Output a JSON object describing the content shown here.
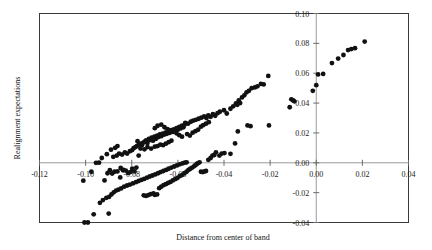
{
  "chart_data": {
    "type": "scatter",
    "title": "",
    "xlabel": "Distance from center  of band",
    "ylabel": "Realignment expectations",
    "xlim": [
      -0.12,
      0.04
    ],
    "ylim": [
      -0.04,
      0.1
    ],
    "grid": false,
    "legend": "none",
    "xticks": [
      "-0.12",
      "-0.10",
      "-0.08",
      "-0.06",
      "-0.04",
      "-0.02",
      "0.00",
      "0.02",
      "0.04"
    ],
    "xtick_values": [
      -0.12,
      -0.1,
      -0.08,
      -0.06,
      -0.04,
      -0.02,
      0.0,
      0.02,
      0.04
    ],
    "yticks": [
      "0.10",
      "0.08",
      "0.06",
      "0.04",
      "0.02",
      "0.00",
      "-0.02",
      "-0.04"
    ],
    "ytick_values": [
      0.1,
      0.08,
      0.06,
      0.04,
      0.02,
      0.0,
      -0.02,
      -0.04
    ],
    "yaxis_position": "at x = 0.00 (interior, right side)",
    "point_color": "#111111",
    "point_radius_px": 2.4,
    "series": [
      {
        "name": "Realignment expectations vs distance from center of band",
        "points": [
          [
            -0.1005,
            -0.04
          ],
          [
            -0.099,
            -0.04
          ],
          [
            -0.0965,
            -0.0345
          ],
          [
            -0.09,
            -0.034
          ],
          [
            -0.0938,
            -0.0268
          ],
          [
            -0.0925,
            -0.025
          ],
          [
            -0.091,
            -0.0235
          ],
          [
            -0.0898,
            -0.0228
          ],
          [
            -0.0888,
            -0.0212
          ],
          [
            -0.0878,
            -0.0198
          ],
          [
            -0.0868,
            -0.0186
          ],
          [
            -0.0858,
            -0.018
          ],
          [
            -0.0846,
            -0.0172
          ],
          [
            -0.0833,
            -0.016
          ],
          [
            -0.082,
            -0.0152
          ],
          [
            -0.0808,
            -0.0146
          ],
          [
            -0.0795,
            -0.0138
          ],
          [
            -0.0782,
            -0.013
          ],
          [
            -0.077,
            -0.0122
          ],
          [
            -0.0758,
            -0.0115
          ],
          [
            -0.0746,
            -0.0108
          ],
          [
            -0.0734,
            -0.01
          ],
          [
            -0.0722,
            -0.0092
          ],
          [
            -0.071,
            -0.0085
          ],
          [
            -0.0698,
            -0.0078
          ],
          [
            -0.0686,
            -0.007
          ],
          [
            -0.0675,
            -0.0062
          ],
          [
            -0.0663,
            -0.0055
          ],
          [
            -0.0651,
            -0.0048
          ],
          [
            -0.064,
            -0.004
          ],
          [
            -0.0628,
            -0.0032
          ],
          [
            -0.0616,
            -0.0025
          ],
          [
            -0.0604,
            -0.0018
          ],
          [
            -0.0592,
            -0.001
          ],
          [
            -0.058,
            -0.0004
          ],
          [
            -0.057,
            0.0001
          ],
          [
            -0.0562,
            0.0003
          ],
          [
            -0.0748,
            -0.0218
          ],
          [
            -0.0738,
            -0.0222
          ],
          [
            -0.0728,
            -0.0216
          ],
          [
            -0.0718,
            -0.021
          ],
          [
            -0.0706,
            -0.0205
          ],
          [
            -0.07,
            -0.0215
          ],
          [
            -0.069,
            -0.0212
          ],
          [
            -0.0681,
            -0.017
          ],
          [
            -0.0672,
            -0.016
          ],
          [
            -0.0662,
            -0.015
          ],
          [
            -0.0652,
            -0.0143
          ],
          [
            -0.0642,
            -0.0135
          ],
          [
            -0.0632,
            -0.0128
          ],
          [
            -0.0622,
            -0.0118
          ],
          [
            -0.0612,
            -0.011
          ],
          [
            -0.0602,
            -0.0102
          ],
          [
            -0.0592,
            -0.009
          ],
          [
            -0.0582,
            -0.0082
          ],
          [
            -0.0572,
            -0.007
          ],
          [
            -0.0562,
            -0.006
          ],
          [
            -0.0554,
            -0.0048
          ],
          [
            -0.0546,
            -0.004
          ],
          [
            -0.0538,
            -0.0032
          ],
          [
            -0.053,
            -0.0024
          ],
          [
            -0.0524,
            -0.0016
          ],
          [
            -0.0518,
            -0.0008
          ],
          [
            -0.0512,
            -0.0002
          ],
          [
            -0.0506,
            0.0003
          ],
          [
            -0.05,
            -0.006
          ],
          [
            -0.0492,
            -0.0062
          ],
          [
            -0.0485,
            -0.0058
          ],
          [
            -0.0478,
            -0.0055
          ],
          [
            -0.0468,
            0.002
          ],
          [
            -0.0458,
            0.0032
          ],
          [
            -0.045,
            0.0048
          ],
          [
            -0.0442,
            0.0052
          ],
          [
            -0.0435,
            0.007
          ],
          [
            -0.042,
            0.0048
          ],
          [
            -0.041,
            0.0062
          ],
          [
            -0.0398,
            0.0065
          ],
          [
            -0.0372,
            0.006
          ],
          [
            -0.0352,
            0.013
          ],
          [
            -0.034,
            0.021
          ],
          [
            -0.0298,
            0.025
          ],
          [
            -0.0285,
            0.0245
          ],
          [
            -0.0205,
            0.025
          ],
          [
            -0.0115,
            0.0372
          ],
          [
            -0.101,
            -0.012
          ],
          [
            -0.0975,
            -0.006
          ],
          [
            -0.0955,
            0.0
          ],
          [
            -0.0942,
            0.0001
          ],
          [
            -0.0918,
            -0.0118
          ],
          [
            -0.0905,
            -0.007
          ],
          [
            -0.0895,
            -0.005
          ],
          [
            -0.0885,
            -0.0072
          ],
          [
            -0.0875,
            -0.006
          ],
          [
            -0.0862,
            -0.0058
          ],
          [
            -0.085,
            -0.0098
          ],
          [
            -0.0838,
            -0.005
          ],
          [
            -0.0848,
            -0.0035
          ],
          [
            -0.0836,
            -0.0048
          ],
          [
            -0.0826,
            -0.0052
          ],
          [
            -0.0816,
            -0.0068
          ],
          [
            -0.0806,
            -0.0062
          ],
          [
            -0.0798,
            -0.004
          ],
          [
            -0.0788,
            -0.0058
          ],
          [
            -0.078,
            -0.0032
          ],
          [
            -0.077,
            0.0048
          ],
          [
            -0.088,
            0.004
          ],
          [
            -0.0865,
            0.0048
          ],
          [
            -0.0855,
            0.0062
          ],
          [
            -0.0842,
            0.0055
          ],
          [
            -0.083,
            0.007
          ],
          [
            -0.082,
            0.0062
          ],
          [
            -0.0808,
            0.0078
          ],
          [
            -0.0798,
            0.0085
          ],
          [
            -0.0792,
            0.0098
          ],
          [
            -0.0784,
            0.0105
          ],
          [
            -0.0778,
            0.0112
          ],
          [
            -0.077,
            0.012
          ],
          [
            -0.0762,
            0.0128
          ],
          [
            -0.0756,
            0.0118
          ],
          [
            -0.075,
            0.0135
          ],
          [
            -0.0744,
            0.0142
          ],
          [
            -0.0738,
            0.015
          ],
          [
            -0.0732,
            0.0132
          ],
          [
            -0.0726,
            0.016
          ],
          [
            -0.072,
            0.0152
          ],
          [
            -0.0714,
            0.0168
          ],
          [
            -0.0708,
            0.0148
          ],
          [
            -0.0702,
            0.0175
          ],
          [
            -0.0696,
            0.016
          ],
          [
            -0.069,
            0.0182
          ],
          [
            -0.0684,
            0.0172
          ],
          [
            -0.0678,
            0.019
          ],
          [
            -0.0672,
            0.0178
          ],
          [
            -0.0666,
            0.0196
          ],
          [
            -0.066,
            0.0188
          ],
          [
            -0.0654,
            0.0202
          ],
          [
            -0.0648,
            0.0194
          ],
          [
            -0.0642,
            0.021
          ],
          [
            -0.0636,
            0.02
          ],
          [
            -0.063,
            0.0218
          ],
          [
            -0.0624,
            0.0208
          ],
          [
            -0.0618,
            0.0224
          ],
          [
            -0.0612,
            0.0214
          ],
          [
            -0.0606,
            0.0232
          ],
          [
            -0.06,
            0.0222
          ],
          [
            -0.0594,
            0.024
          ],
          [
            -0.0588,
            0.023
          ],
          [
            -0.0582,
            0.0248
          ],
          [
            -0.0576,
            0.0238
          ],
          [
            -0.057,
            0.0256
          ],
          [
            -0.093,
            0.0032
          ],
          [
            -0.0908,
            0.0058
          ],
          [
            -0.089,
            0.0088
          ],
          [
            -0.0872,
            0.01
          ],
          [
            -0.0862,
            0.0112
          ],
          [
            -0.0775,
            0.0145
          ],
          [
            -0.0762,
            0.0095
          ],
          [
            -0.0745,
            0.009
          ],
          [
            -0.0732,
            0.0105
          ],
          [
            -0.0716,
            0.0095
          ],
          [
            -0.07,
            0.0108
          ],
          [
            -0.0688,
            0.0112
          ],
          [
            -0.0676,
            0.0122
          ],
          [
            -0.0664,
            0.0118
          ],
          [
            -0.0652,
            0.0128
          ],
          [
            -0.064,
            0.0138
          ],
          [
            -0.0628,
            0.0148
          ],
          [
            -0.07,
            0.0232
          ],
          [
            -0.0688,
            0.0248
          ],
          [
            -0.0672,
            0.0255
          ],
          [
            -0.0658,
            0.0238
          ],
          [
            -0.0645,
            0.0225
          ],
          [
            -0.0632,
            0.0215
          ],
          [
            -0.062,
            0.0208
          ],
          [
            -0.0606,
            0.0198
          ],
          [
            -0.0594,
            0.0185
          ],
          [
            -0.0582,
            0.0175
          ],
          [
            -0.0568,
            0.0268
          ],
          [
            -0.0556,
            0.0262
          ],
          [
            -0.0544,
            0.0275
          ],
          [
            -0.0534,
            0.0282
          ],
          [
            -0.0522,
            0.0288
          ],
          [
            -0.051,
            0.0295
          ],
          [
            -0.0498,
            0.0302
          ],
          [
            -0.0486,
            0.031
          ],
          [
            -0.0476,
            0.03
          ],
          [
            -0.0468,
            0.0318
          ],
          [
            -0.0458,
            0.0308
          ],
          [
            -0.0448,
            0.0325
          ],
          [
            -0.0438,
            0.0315
          ],
          [
            -0.0428,
            0.0332
          ],
          [
            -0.0418,
            0.0342
          ],
          [
            -0.056,
            0.0192
          ],
          [
            -0.0548,
            0.0182
          ],
          [
            -0.0536,
            0.0202
          ],
          [
            -0.0524,
            0.0212
          ],
          [
            -0.0512,
            0.0222
          ],
          [
            -0.05,
            0.0242
          ],
          [
            -0.049,
            0.0252
          ],
          [
            -0.0478,
            0.0262
          ],
          [
            -0.0466,
            0.0272
          ],
          [
            -0.04,
            0.0352
          ],
          [
            -0.0388,
            0.033
          ],
          [
            -0.0372,
            0.0362
          ],
          [
            -0.036,
            0.0378
          ],
          [
            -0.0348,
            0.0398
          ],
          [
            -0.0336,
            0.0418
          ],
          [
            -0.0322,
            0.0438
          ],
          [
            -0.0312,
            0.0452
          ],
          [
            -0.0302,
            0.0472
          ],
          [
            -0.0342,
            0.0388
          ],
          [
            -0.033,
            0.04
          ],
          [
            -0.0292,
            0.0482
          ],
          [
            -0.028,
            0.05
          ],
          [
            -0.0266,
            0.0505
          ],
          [
            -0.0255,
            0.0512
          ],
          [
            -0.024,
            0.0528
          ],
          [
            -0.0228,
            0.0525
          ],
          [
            -0.0208,
            0.0582
          ],
          [
            -0.0108,
            0.0425
          ],
          [
            -0.01,
            0.0418
          ],
          [
            -0.0095,
            0.0412
          ],
          [
            -0.0015,
            0.0482
          ],
          [
            0.0,
            0.052
          ],
          [
            0.0008,
            0.0592
          ],
          [
            0.003,
            0.0595
          ],
          [
            0.0068,
            0.0668
          ],
          [
            0.0095,
            0.0698
          ],
          [
            0.0118,
            0.0722
          ],
          [
            0.0138,
            0.0755
          ],
          [
            0.0152,
            0.0762
          ],
          [
            0.0168,
            0.0768
          ],
          [
            0.021,
            0.0812
          ]
        ]
      }
    ]
  }
}
